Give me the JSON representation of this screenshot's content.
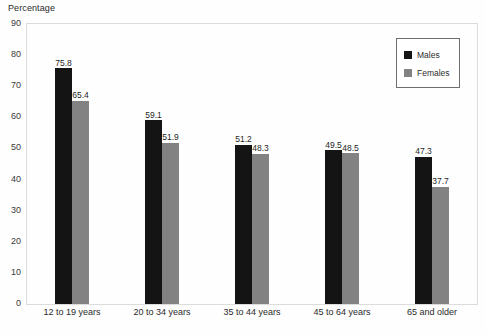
{
  "chart_data": {
    "type": "bar",
    "title": "",
    "xlabel": "",
    "ylabel": "Percentage",
    "ylim": [
      0,
      90
    ],
    "ytick_step": 10,
    "yticks": [
      "90",
      "80",
      "70",
      "60",
      "50",
      "40",
      "30",
      "20",
      "10",
      "0"
    ],
    "grid": false,
    "legend_position": "top-right",
    "categories": [
      "12 to 19 years",
      "20 to 34 years",
      "35 to 44 years",
      "45 to 64 years",
      "65 and older"
    ],
    "series": [
      {
        "name": "Males",
        "color": "#141414",
        "values": [
          75.8,
          59.1,
          51.2,
          49.5,
          47.3
        ],
        "labels": [
          "75.8",
          "59.1",
          "51.2",
          "49.5",
          "47.3"
        ]
      },
      {
        "name": "Females",
        "color": "#828282",
        "values": [
          65.4,
          51.9,
          48.3,
          48.5,
          37.7
        ],
        "labels": [
          "65.4",
          "51.9",
          "48.3",
          "48.5",
          "37.7"
        ]
      }
    ]
  },
  "legend": {
    "entries": [
      {
        "label": "Males"
      },
      {
        "label": "Females"
      }
    ]
  }
}
